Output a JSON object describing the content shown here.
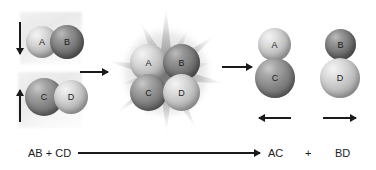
{
  "diagram": {
    "type": "reaction-mechanism",
    "background_color": "#ffffff",
    "label_color": "#1c1c1c",
    "arrow_color": "#1a1a1a"
  },
  "reactants": {
    "molecules": [
      {
        "name": "AB",
        "atoms": [
          {
            "label": "A",
            "shade": "light"
          },
          {
            "label": "B",
            "shade": "darker"
          }
        ],
        "motion_arrow": "down"
      },
      {
        "name": "CD",
        "atoms": [
          {
            "label": "C",
            "shade": "dark"
          },
          {
            "label": "D",
            "shade": "light"
          }
        ],
        "motion_arrow": "up"
      }
    ]
  },
  "transition_state": {
    "name": "activated-complex",
    "atoms": [
      {
        "label": "A",
        "shade": "light"
      },
      {
        "label": "B",
        "shade": "darker"
      },
      {
        "label": "C",
        "shade": "dark"
      },
      {
        "label": "D",
        "shade": "light"
      }
    ],
    "effect": "starburst-collision",
    "spike_count": 14
  },
  "products": {
    "molecules": [
      {
        "name": "AC",
        "atoms": [
          {
            "label": "A",
            "shade": "light"
          },
          {
            "label": "C",
            "shade": "dark"
          }
        ],
        "motion_arrow": "left"
      },
      {
        "name": "BD",
        "atoms": [
          {
            "label": "B",
            "shade": "darker"
          },
          {
            "label": "D",
            "shade": "light"
          }
        ],
        "motion_arrow": "right"
      }
    ]
  },
  "process_arrows": [
    {
      "name": "reactants-to-transition",
      "direction": "right"
    },
    {
      "name": "transition-to-products",
      "direction": "right"
    }
  ],
  "equation": {
    "reactants": "AB + CD",
    "product_first": "AC",
    "plus": "+",
    "product_second": "BD",
    "arrow_direction": "right"
  }
}
